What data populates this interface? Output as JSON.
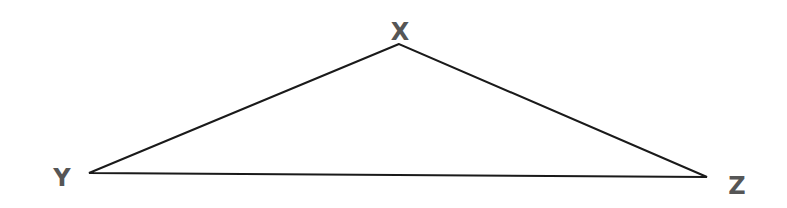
{
  "diagram": {
    "type": "triangle",
    "stroke_color": "#1a1a1a",
    "label_color": "#565656",
    "vertices": [
      {
        "name": "X",
        "x": 399,
        "y": 44,
        "label_x": 400,
        "label_y": 40
      },
      {
        "name": "Y",
        "x": 89,
        "y": 173,
        "label_x": 62,
        "label_y": 186
      },
      {
        "name": "Z",
        "x": 707,
        "y": 177,
        "label_x": 737,
        "label_y": 194
      }
    ],
    "edges": [
      {
        "from": "X",
        "to": "Y"
      },
      {
        "from": "Y",
        "to": "Z"
      },
      {
        "from": "Z",
        "to": "X"
      }
    ],
    "labels": {
      "x": "X",
      "y": "Y",
      "z": "Z"
    }
  }
}
